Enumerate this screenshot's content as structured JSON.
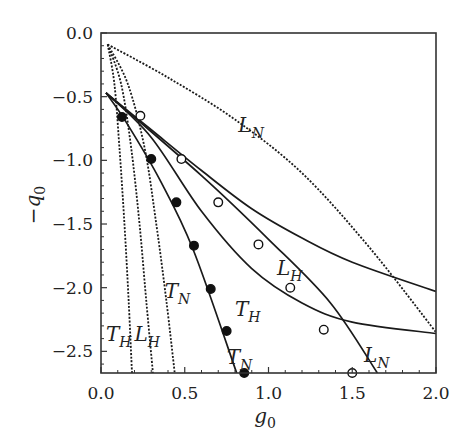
{
  "chart_data": {
    "type": "line",
    "title": "",
    "xlabel": "g_0",
    "ylabel": "-q_0",
    "xlim": [
      0.0,
      2.0
    ],
    "ylim": [
      -2.67,
      0.0
    ],
    "grid": false,
    "legend": "none (curves labeled inline)",
    "x_ticks": [
      "0.0",
      "0.5",
      "1.0",
      "1.5",
      "2.0"
    ],
    "x_tick_values": [
      0.0,
      0.5,
      1.0,
      1.5,
      2.0
    ],
    "y_ticks": [
      "0.0",
      "-0.5",
      "-1.0",
      "-1.5",
      "-2.0",
      "-2.5"
    ],
    "y_tick_values": [
      0.0,
      -0.5,
      -1.0,
      -1.5,
      -2.0,
      -2.5
    ],
    "series": [
      {
        "name": "L_N (dotted)",
        "style": "dotted",
        "label": {
          "main": "L",
          "sub": "N",
          "x": 0.82,
          "y": -0.78
        },
        "points": [
          [
            0.04,
            -0.09
          ],
          [
            0.4,
            -0.35
          ],
          [
            0.8,
            -0.68
          ],
          [
            1.2,
            -1.1
          ],
          [
            1.6,
            -1.68
          ],
          [
            2.0,
            -2.35
          ]
        ]
      },
      {
        "name": "T_H (dotted)",
        "style": "dotted",
        "label": {
          "main": "T",
          "sub": "H",
          "x": 0.03,
          "y": -2.42
        },
        "points": [
          [
            0.04,
            -0.09
          ],
          [
            0.08,
            -0.4
          ],
          [
            0.11,
            -0.9
          ],
          [
            0.14,
            -1.5
          ],
          [
            0.165,
            -2.1
          ],
          [
            0.185,
            -2.67
          ]
        ]
      },
      {
        "name": "L_H (dotted)",
        "style": "dotted",
        "label": {
          "main": "L",
          "sub": "H",
          "x": 0.2,
          "y": -2.42
        },
        "points": [
          [
            0.04,
            -0.09
          ],
          [
            0.12,
            -0.4
          ],
          [
            0.18,
            -0.9
          ],
          [
            0.23,
            -1.5
          ],
          [
            0.27,
            -2.1
          ],
          [
            0.31,
            -2.67
          ]
        ]
      },
      {
        "name": "T_N (dotted)",
        "style": "dotted",
        "label": {
          "main": "T",
          "sub": "N",
          "x": 0.38,
          "y": -2.08
        },
        "points": [
          [
            0.04,
            -0.09
          ],
          [
            0.16,
            -0.4
          ],
          [
            0.26,
            -0.9
          ],
          [
            0.33,
            -1.5
          ],
          [
            0.39,
            -2.1
          ],
          [
            0.44,
            -2.67
          ]
        ]
      },
      {
        "name": "L_H (solid)",
        "style": "solid",
        "label": {
          "main": "L",
          "sub": "H",
          "x": 1.05,
          "y": -1.9
        },
        "points": [
          [
            0.03,
            -0.47
          ],
          [
            0.3,
            -0.76
          ],
          [
            0.6,
            -1.08
          ],
          [
            0.9,
            -1.38
          ],
          [
            1.2,
            -1.61
          ],
          [
            1.5,
            -1.8
          ],
          [
            2.0,
            -2.03
          ]
        ]
      },
      {
        "name": "T_H (solid)",
        "style": "solid",
        "label": {
          "main": "T",
          "sub": "H",
          "x": 0.8,
          "y": -2.22
        },
        "points": [
          [
            0.03,
            -0.47
          ],
          [
            0.3,
            -0.82
          ],
          [
            0.6,
            -1.4
          ],
          [
            0.9,
            -1.85
          ],
          [
            1.2,
            -2.12
          ],
          [
            1.5,
            -2.27
          ],
          [
            2.0,
            -2.36
          ]
        ]
      },
      {
        "name": "L_N (solid)",
        "style": "solid",
        "label": {
          "main": "L",
          "sub": "N",
          "x": 1.57,
          "y": -2.58
        },
        "points": [
          [
            0.03,
            -0.47
          ],
          [
            0.6,
            -1.12
          ],
          [
            1.0,
            -1.62
          ],
          [
            1.37,
            -2.12
          ],
          [
            1.65,
            -2.67
          ]
        ]
      },
      {
        "name": "T_N (solid)",
        "style": "solid",
        "label": {
          "main": "T",
          "sub": "N",
          "x": 0.75,
          "y": -2.6
        },
        "points": [
          [
            0.03,
            -0.47
          ],
          [
            0.15,
            -0.7
          ],
          [
            0.35,
            -1.15
          ],
          [
            0.55,
            -1.7
          ],
          [
            0.81,
            -2.67
          ]
        ]
      }
    ],
    "markers": [
      {
        "name": "filled circles",
        "fill": "#111111",
        "points": [
          [
            0.125,
            -0.66
          ],
          [
            0.3,
            -0.99
          ],
          [
            0.45,
            -1.33
          ],
          [
            0.555,
            -1.67
          ],
          [
            0.655,
            -2.01
          ],
          [
            0.75,
            -2.34
          ],
          [
            0.855,
            -2.67
          ]
        ]
      },
      {
        "name": "open circles",
        "fill": "#ffffff",
        "points": [
          [
            0.235,
            -0.65
          ],
          [
            0.48,
            -0.99
          ],
          [
            0.7,
            -1.33
          ],
          [
            0.94,
            -1.66
          ],
          [
            1.13,
            -2.0
          ],
          [
            1.33,
            -2.33
          ],
          [
            1.5,
            -2.67
          ]
        ]
      }
    ]
  }
}
